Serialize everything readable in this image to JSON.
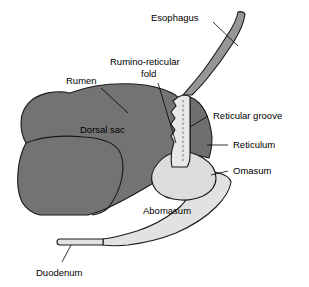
{
  "diagram": {
    "background_color": "#ffffff",
    "colors": {
      "rumen_fill": "#737373",
      "reticulum_fill": "#6f6f6f",
      "esophagus_fill": "#969696",
      "omasum_fill": "#dcdcdc",
      "abomasum_fill": "#e2e2e2",
      "duodenum_fill": "#e2e2e2",
      "groove_fill": "#e8e8e8",
      "outline": "#1a1a1a",
      "label_text": "#000000"
    },
    "labels": {
      "esophagus": "Esophagus",
      "rumen": "Rumen",
      "rumino_reticular_fold_line1": "Rumino-reticular",
      "rumino_reticular_fold_line2": "fold",
      "dorsal_sac": "Dorsal sac",
      "reticular_groove": "Reticular groove",
      "reticulum": "Reticulum",
      "omasum": "Omasum",
      "abomasum": "Abomasum",
      "duodenum": "Duodenum"
    }
  }
}
